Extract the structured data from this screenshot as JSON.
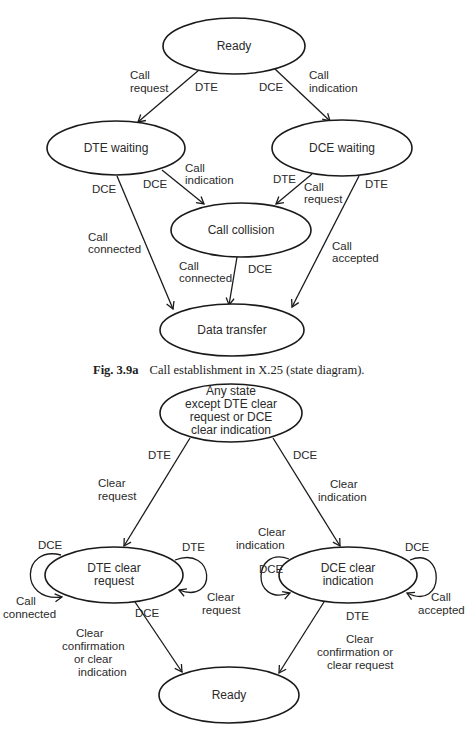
{
  "figure_a": {
    "caption_label": "Fig. 3.9a",
    "caption_text": "Call establishment in X.25 (state diagram).",
    "states": {
      "ready": "Ready",
      "dte_waiting": "DTE waiting",
      "dce_waiting": "DCE waiting",
      "call_collision": "Call collision",
      "data_transfer": "Data transfer"
    },
    "transitions": [
      {
        "from": "Ready",
        "to": "DTE waiting",
        "actor": "DTE",
        "event_line1": "Call",
        "event_line2": "request"
      },
      {
        "from": "Ready",
        "to": "DCE waiting",
        "actor": "DCE",
        "event_line1": "Call",
        "event_line2": "indication"
      },
      {
        "from": "DTE waiting",
        "to": "Call collision",
        "actor": "DCE",
        "event_line1": "Call",
        "event_line2": "indication"
      },
      {
        "from": "DCE waiting",
        "to": "Call collision",
        "actor": "DTE",
        "event_line1": "Call",
        "event_line2": "request"
      },
      {
        "from": "DTE waiting",
        "to": "Data transfer",
        "actor": "DCE",
        "event_line1": "Call",
        "event_line2": "connected"
      },
      {
        "from": "Call collision",
        "to": "Data transfer",
        "actor": "DCE",
        "event_line1": "Call",
        "event_line2": "connected"
      },
      {
        "from": "DCE waiting",
        "to": "Data transfer",
        "actor": "DTE",
        "event_line1": "Call",
        "event_line2": "accepted"
      }
    ]
  },
  "figure_b": {
    "states": {
      "any_state_line1": "Any state",
      "any_state_line2": "except DTE clear",
      "any_state_line3": "request or DCE",
      "any_state_line4": "clear indication",
      "dte_clear_line1": "DTE clear",
      "dte_clear_line2": "request",
      "dce_clear_line1": "DCE clear",
      "dce_clear_line2": "indication",
      "ready": "Ready"
    },
    "transitions": [
      {
        "from": "Any state",
        "to": "DTE clear request",
        "actor": "DTE",
        "event_line1": "Clear",
        "event_line2": "request"
      },
      {
        "from": "Any state",
        "to": "DCE clear indication",
        "actor": "DCE",
        "event_line1": "Clear",
        "event_line2": "indication"
      },
      {
        "from": "DTE clear request",
        "to": "DTE clear request",
        "actor": "DCE",
        "event_line1": "Call",
        "event_line2": "connected"
      },
      {
        "from": "DTE clear request",
        "to": "DTE clear request",
        "actor": "DTE",
        "event_line1": "Clear",
        "event_line2": "request"
      },
      {
        "from": "DCE clear indication",
        "to": "DCE clear indication",
        "actor": "DCE",
        "event_line1": "Clear",
        "event_line2": "indication"
      },
      {
        "from": "DCE clear indication",
        "to": "DCE clear indication",
        "actor": "DCE",
        "event_line1": "Call",
        "event_line2": "accepted"
      },
      {
        "from": "DTE clear request",
        "to": "Ready",
        "actor": "DCE",
        "event_line1": "Clear",
        "event_line2": "confirmation",
        "event_line3": "or clear",
        "event_line4": "indication"
      },
      {
        "from": "DCE clear indication",
        "to": "Ready",
        "actor": "DTE",
        "event_line1": "Clear",
        "event_line2": "confirmation or",
        "event_line3": "clear request"
      }
    ]
  }
}
